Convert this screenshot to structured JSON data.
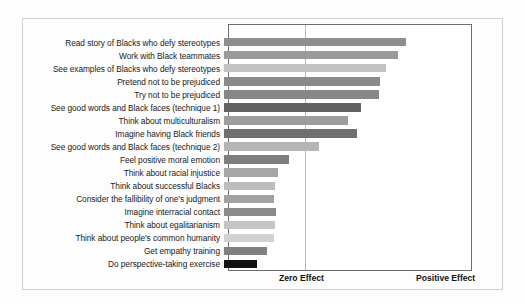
{
  "chart_data": {
    "type": "bar",
    "orientation": "horizontal",
    "title": "",
    "xlabel": "",
    "ylabel": "",
    "grid": true,
    "legend": "none",
    "axis_tick_labels": [
      "Zero Effect",
      "Positive Effect"
    ],
    "axis_tick_positions": [
      0,
      100
    ],
    "xlim": [
      0,
      100
    ],
    "note": "Bar length encodes effect size from Zero Effect (gridline) toward Positive Effect (right edge).",
    "categories": [
      "Read story of Blacks who defy stereotypes",
      "Work with Black teammates",
      "See examples of Blacks who defy stereotypes",
      "Pretend not to be prejudiced",
      "Try not to be prejudiced",
      "See good words and Black faces (technique 1)",
      "Think about multiculturalism",
      "Imagine having Black friends",
      "See good words and Black faces (technique 2)",
      "Feel positive moral emotion",
      "Think about racial injustice",
      "Think about successful Blacks",
      "Consider the fallibility of one's judgment",
      "Imagine interracial contact",
      "Think about egalitarianism",
      "Think about people's common humanity",
      "Get empathy training",
      "Do perspective-taking exercise"
    ],
    "values": [
      74.5,
      71.5,
      66.5,
      64.0,
      63.5,
      56.0,
      51.0,
      54.5,
      39.0,
      26.5,
      22.0,
      21.0,
      20.5,
      21.5,
      21.0,
      20.5,
      17.5,
      13.5
    ],
    "bar_colors": [
      "#8e8e8e",
      "#9a9a9a",
      "#c2c2c2",
      "#8a8a8a",
      "#878787",
      "#636363",
      "#9d9d9d",
      "#6f6f6f",
      "#b5b5b5",
      "#7e7e7e",
      "#a6a6a6",
      "#bdbdbd",
      "#a2a2a2",
      "#8b8b8b",
      "#c4c4c4",
      "#d2d2d2",
      "#808080",
      "#121212"
    ]
  },
  "axis": {
    "zero_label": "Zero Effect",
    "positive_label": "Positive Effect"
  }
}
